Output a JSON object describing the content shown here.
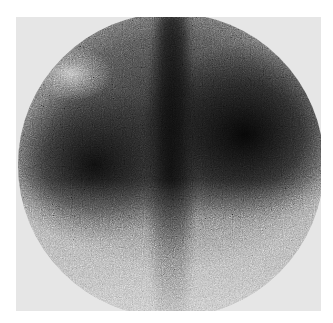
{
  "image": {
    "description": "Grayscale circular gamma-camera scintigraphy scan with grainy texture",
    "colors": {
      "background": "#ffffff",
      "field_backdrop": "#e6e6e6",
      "dark_uptake": "#0a0a0a",
      "light_region": "#c8c8c8"
    }
  }
}
